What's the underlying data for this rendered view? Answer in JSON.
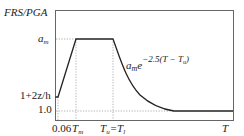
{
  "diagram": {
    "y_axis_label": "FRS/PGA",
    "x_axis_label": "T",
    "y_ticks": [
      "a_m",
      "1+2z/h",
      "1.0"
    ],
    "x_ticks": [
      "0.06",
      "T_m",
      "T_u=T_l"
    ],
    "curve_formula": {
      "base": "a_m e",
      "exponent": "−2.5(T − T_u)"
    },
    "labels": {
      "am": "a",
      "am_sub": "m",
      "one_plus": "1+2z/h",
      "one": "1.0",
      "x006": "0.06",
      "tm": "T",
      "tm_sub": "m",
      "tu": "T",
      "tu_sub": "u",
      "eq": "=T",
      "tl_sub": "l",
      "t": "T",
      "formula_a": "a",
      "formula_a_sub": "m",
      "formula_e": "e",
      "formula_exp": "−2.5(T − T",
      "formula_exp_sub": "u",
      "formula_exp_close": ")"
    },
    "colors": {
      "line": "#222222",
      "frame": "#555555",
      "dotted": "#888888"
    }
  }
}
